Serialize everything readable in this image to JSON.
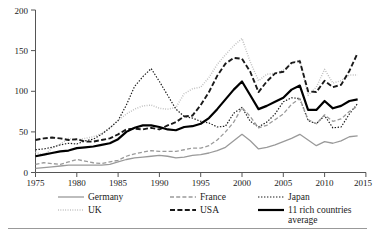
{
  "chart_data": {
    "type": "line",
    "title": "",
    "xlabel": "",
    "ylabel": "",
    "xlim": [
      1975,
      2015
    ],
    "ylim": [
      0,
      200
    ],
    "grid": false,
    "legend_position": "bottom",
    "xticks": [
      "1975",
      "1980",
      "1985",
      "1990",
      "1995",
      "2000",
      "2005",
      "2010",
      "2015"
    ],
    "yticks": [
      "0",
      "50",
      "100",
      "150",
      "200"
    ],
    "x": [
      1975,
      1976,
      1977,
      1978,
      1979,
      1980,
      1981,
      1982,
      1983,
      1984,
      1985,
      1986,
      1987,
      1988,
      1989,
      1990,
      1991,
      1992,
      1993,
      1994,
      1995,
      1996,
      1997,
      1998,
      1999,
      2000,
      2001,
      2002,
      2003,
      2004,
      2005,
      2006,
      2007,
      2008,
      2009,
      2010,
      2011,
      2012,
      2013,
      2014
    ],
    "series": [
      {
        "name": "Germany",
        "style": "solid-grey",
        "color": "#999999",
        "values": [
          5,
          6,
          7,
          8,
          9,
          9,
          9,
          9,
          9,
          10,
          13,
          16,
          18,
          19,
          20,
          21,
          20,
          18,
          19,
          21,
          22,
          24,
          27,
          31,
          39,
          47,
          39,
          29,
          31,
          34,
          38,
          42,
          47,
          40,
          33,
          38,
          36,
          39,
          44,
          45
        ]
      },
      {
        "name": "France",
        "style": "dashed-grey",
        "color": "#999999",
        "values": [
          10,
          12,
          11,
          10,
          13,
          16,
          14,
          12,
          11,
          13,
          15,
          20,
          23,
          25,
          27,
          26,
          26,
          26,
          28,
          30,
          30,
          33,
          40,
          50,
          62,
          80,
          69,
          55,
          58,
          65,
          72,
          84,
          91,
          65,
          60,
          71,
          63,
          66,
          75,
          82
        ]
      },
      {
        "name": "Japan",
        "style": "dotted-black",
        "color": "#1a1a1a",
        "values": [
          28,
          29,
          31,
          34,
          36,
          35,
          39,
          41,
          47,
          55,
          64,
          83,
          106,
          118,
          128,
          112,
          95,
          78,
          69,
          67,
          63,
          61,
          56,
          57,
          73,
          80,
          63,
          56,
          62,
          72,
          87,
          92,
          91,
          64,
          60,
          70,
          55,
          56,
          72,
          85
        ]
      },
      {
        "name": "UK",
        "style": "fine-dotted-grey",
        "color": "#b0b0b0",
        "values": [
          25,
          21,
          30,
          35,
          42,
          40,
          42,
          44,
          48,
          54,
          64,
          72,
          78,
          82,
          83,
          79,
          78,
          80,
          97,
          103,
          105,
          117,
          133,
          145,
          156,
          165,
          136,
          113,
          121,
          122,
          126,
          135,
          138,
          95,
          105,
          127,
          110,
          113,
          120,
          120
        ]
      },
      {
        "name": "USA",
        "style": "dashed-black",
        "color": "#1a1a1a",
        "values": [
          40,
          42,
          43,
          42,
          40,
          41,
          38,
          38,
          40,
          42,
          47,
          53,
          54,
          53,
          55,
          53,
          58,
          62,
          69,
          70,
          83,
          99,
          119,
          134,
          141,
          140,
          124,
          99,
          112,
          122,
          124,
          135,
          137,
          100,
          99,
          113,
          105,
          108,
          125,
          147
        ]
      },
      {
        "name": "11 rich countries average",
        "style": "thick-solid-black",
        "color": "#000000",
        "values": [
          20,
          22,
          24,
          26,
          27,
          30,
          31,
          32,
          34,
          36,
          41,
          50,
          55,
          58,
          58,
          56,
          53,
          52,
          56,
          57,
          60,
          67,
          78,
          90,
          102,
          112,
          95,
          78,
          82,
          87,
          92,
          102,
          107,
          77,
          77,
          88,
          79,
          82,
          88,
          90
        ]
      }
    ]
  },
  "legend": {
    "items": [
      {
        "label": "Germany",
        "style": "solid-grey"
      },
      {
        "label": "France",
        "style": "dashed-grey"
      },
      {
        "label": "Japan",
        "style": "dotted-black"
      },
      {
        "label": "UK",
        "style": "fine-dotted-grey"
      },
      {
        "label": "USA",
        "style": "dashed-black"
      },
      {
        "label": "11 rich countries",
        "label2": "average",
        "style": "thick-solid-black"
      }
    ]
  }
}
